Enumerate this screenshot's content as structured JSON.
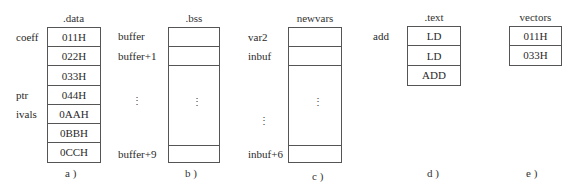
{
  "diagrams": [
    {
      "id": "a",
      "title": ".data",
      "caption": "a )",
      "cells": [
        "011H",
        "022H",
        "033H",
        "044H",
        "0AAH",
        "0BBH",
        "0CCH"
      ],
      "labels": [
        {
          "text": "coeff",
          "row": 0
        },
        {
          "text": "ptr",
          "row": 3
        },
        {
          "text": "ivals",
          "row": 4
        }
      ]
    },
    {
      "id": "b",
      "title": ".bss",
      "caption": "b )",
      "cells": [
        "",
        "",
        "",
        ""
      ],
      "labels": [
        {
          "text": "buffer",
          "row": 0
        },
        {
          "text": "buffer+1",
          "row": 1
        },
        {
          "text": "buffer+9",
          "row": 3
        }
      ],
      "ellipsis": "⋮"
    },
    {
      "id": "c",
      "title": "newvars",
      "caption": "c )",
      "cells": [
        "",
        "",
        "",
        ""
      ],
      "labels": [
        {
          "text": "var2",
          "row": 0
        },
        {
          "text": "inbuf",
          "row": 1
        },
        {
          "text": "inbuf+6",
          "row": 3
        }
      ],
      "ellipsis": "⋮"
    },
    {
      "id": "d",
      "title": ".text",
      "caption": "d )",
      "cells": [
        "LD",
        "LD",
        "ADD"
      ],
      "labels": [
        {
          "text": "add",
          "row": 0
        }
      ]
    },
    {
      "id": "e",
      "title": "vectors",
      "caption": "e )",
      "cells": [
        "011H",
        "033H"
      ],
      "labels": []
    }
  ]
}
